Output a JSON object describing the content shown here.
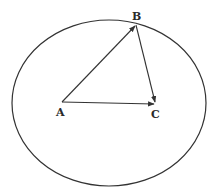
{
  "diagram": {
    "type": "geometry",
    "stroke_color": "#333333",
    "ellipse": {
      "cx": 109,
      "cy": 103,
      "rx": 97,
      "ry": 83
    },
    "points": [
      {
        "id": "A",
        "label": "A",
        "x": 62,
        "y": 102
      },
      {
        "id": "B",
        "label": "B",
        "x": 136,
        "y": 25
      },
      {
        "id": "C",
        "label": "C",
        "x": 156,
        "y": 104
      }
    ],
    "vectors": [
      {
        "from": "A",
        "to": "B"
      },
      {
        "from": "B",
        "to": "C"
      },
      {
        "from": "A",
        "to": "C"
      }
    ]
  },
  "labels": {
    "a": "A",
    "b": "B",
    "c": "C"
  }
}
